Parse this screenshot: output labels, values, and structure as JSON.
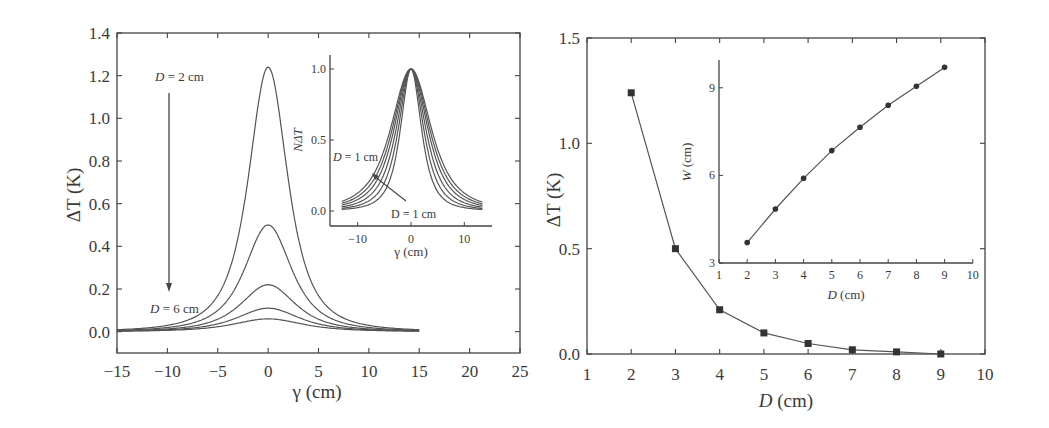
{
  "chart_data": [
    {
      "type": "line",
      "title": "",
      "xlabel": "γ (cm)",
      "ylabel": "ΔT (K)",
      "xlim": [
        -15,
        25
      ],
      "ylim": [
        -0.1,
        1.4
      ],
      "xticks": [
        "−15",
        "−10",
        "−5",
        "0",
        "5",
        "10",
        "15",
        "20",
        "25"
      ],
      "yticks": [
        "0.0",
        "0.2",
        "0.4",
        "0.6",
        "0.8",
        "1.0",
        "1.2",
        "1.4"
      ],
      "grid": false,
      "series": [
        {
          "name": "D = 2 cm",
          "peak": 1.24,
          "width": 3.0
        },
        {
          "name": "D = 3 cm",
          "peak": 0.5,
          "width": 3.6
        },
        {
          "name": "D = 4 cm",
          "peak": 0.22,
          "width": 4.2
        },
        {
          "name": "D = 5 cm",
          "peak": 0.11,
          "width": 4.8
        },
        {
          "name": "D = 6 cm",
          "peak": 0.06,
          "width": 5.3
        }
      ],
      "x_range": [
        -15,
        15
      ],
      "annotations": [
        {
          "text_prefix": "D",
          "text_suffix": " = 2 cm",
          "position": "top-left"
        },
        {
          "text_prefix": "D",
          "text_suffix": " = 6 cm",
          "position": "bottom-left"
        },
        {
          "text": "arrow from D = 2 cm down to D = 6 cm"
        }
      ],
      "inset": {
        "type": "line",
        "xlabel": "γ (cm)",
        "ylabel": "NΔT",
        "xlim": [
          -14,
          15
        ],
        "ylim": [
          -0.08,
          1.1
        ],
        "xticks": [
          "−10",
          "0",
          "10"
        ],
        "yticks": [
          "0.0",
          "0.5",
          "1.0"
        ],
        "series_widths": [
          3.0,
          3.6,
          4.2,
          4.8,
          5.3,
          5.8
        ],
        "annotations": [
          {
            "text_prefix": "D",
            "text_suffix": " = 1 cm"
          },
          {
            "text": "D = 1 cm"
          }
        ]
      }
    },
    {
      "type": "line",
      "title": "",
      "xlabel_prefix": "D",
      "xlabel": "D (cm)",
      "ylabel": "ΔT (K)",
      "xlim": [
        1,
        10
      ],
      "ylim": [
        0,
        1.5
      ],
      "xticks": [
        "1",
        "2",
        "3",
        "4",
        "5",
        "6",
        "7",
        "8",
        "9",
        "10"
      ],
      "yticks": [
        "0.0",
        "0.5",
        "1.0",
        "1.5"
      ],
      "grid": false,
      "x": [
        2,
        3,
        4,
        5,
        6,
        7,
        8,
        9
      ],
      "series": [
        {
          "name": "ΔT",
          "marker": "square",
          "values": [
            1.24,
            0.5,
            0.21,
            0.1,
            0.05,
            0.02,
            0.01,
            0.0
          ]
        }
      ],
      "inset": {
        "type": "line",
        "xlabel": "D (cm)",
        "ylabel": "W (cm)",
        "xlim": [
          1,
          10
        ],
        "ylim": [
          3,
          10
        ],
        "xticks": [
          "1",
          "2",
          "3",
          "4",
          "5",
          "6",
          "7",
          "8",
          "9",
          "10"
        ],
        "yticks": [
          "3",
          "6",
          "9"
        ],
        "x": [
          2,
          3,
          4,
          5,
          6,
          7,
          8,
          9
        ],
        "series": [
          {
            "name": "W",
            "marker": "circle",
            "values": [
              3.7,
              4.85,
              5.9,
              6.85,
              7.65,
              8.4,
              9.05,
              9.7
            ]
          }
        ]
      }
    }
  ],
  "labels": {
    "left_ylabel": "ΔT (K)",
    "left_xlabel": "γ (cm)",
    "left_ann_top_var": "D",
    "left_ann_top_val": " = 2 cm",
    "left_ann_bot_var": "D",
    "left_ann_bot_val": " = 6 cm",
    "inset_ylabel": "NΔT",
    "inset_xlabel": "γ (cm)",
    "inset_ann1_var": "D",
    "inset_ann1_val": " = 1 cm",
    "inset_ann2": "D = 1 cm",
    "right_ylabel": "ΔT (K)",
    "right_xlabel_var": "D",
    "right_xlabel_unit": " (cm)",
    "rinset_ylabel_var": "W",
    "rinset_ylabel_unit": " (cm)",
    "rinset_xlabel_var": "D",
    "rinset_xlabel_unit": " (cm)"
  }
}
